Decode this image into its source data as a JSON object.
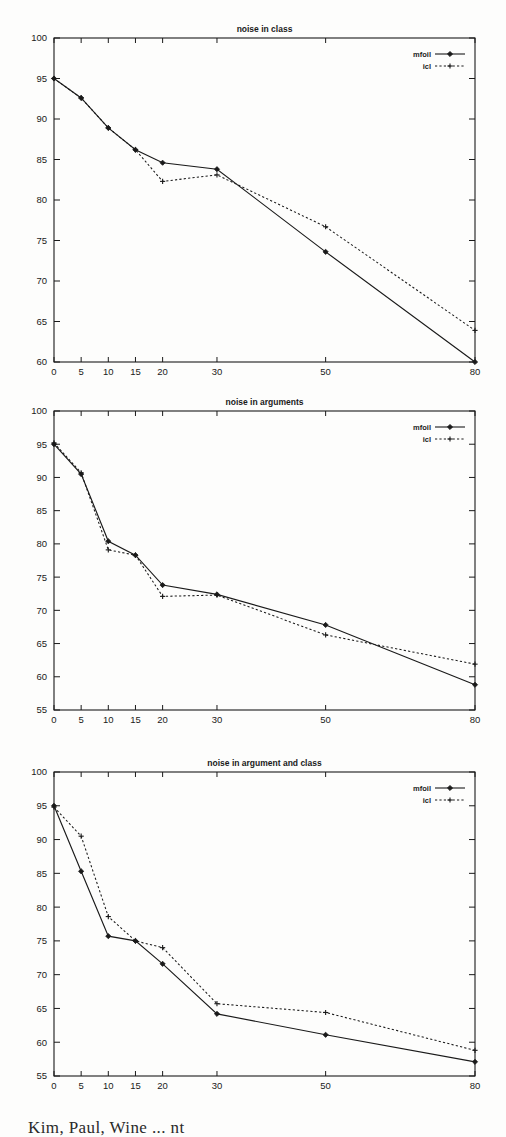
{
  "page": {
    "background_color": "#fdfdfc",
    "ink_color": "#1a1a1a",
    "bottom_caption": "Kim, Paul, Wine ... nt"
  },
  "legend_common": {
    "series_1_label": "mfoil",
    "series_2_label": "icl",
    "position": "top-right"
  },
  "chart_data": [
    {
      "id": "noise-in-class",
      "type": "line",
      "title": "noise in class",
      "xlabel": "",
      "ylabel": "",
      "x": [
        0,
        5,
        10,
        15,
        20,
        30,
        50,
        80
      ],
      "xtick_labels": [
        "0",
        "5",
        "10",
        "15",
        "20",
        "30",
        "50",
        "80"
      ],
      "ytick_labels": [
        "60",
        "65",
        "70",
        "75",
        "80",
        "85",
        "90",
        "95",
        "100"
      ],
      "ylim": [
        60,
        100
      ],
      "grid": false,
      "legend_position": "top-right",
      "series": [
        {
          "name": "mfoil",
          "style": "solid",
          "marker": "filled-diamond",
          "values": [
            95.0,
            92.6,
            88.9,
            86.2,
            84.6,
            83.8,
            73.6,
            60.0
          ]
        },
        {
          "name": "icl",
          "style": "dotted",
          "marker": "plus",
          "values": [
            95.0,
            92.6,
            88.9,
            86.2,
            82.3,
            83.1,
            76.7,
            63.9
          ]
        }
      ]
    },
    {
      "id": "noise-in-arguments",
      "type": "line",
      "title": "noise in arguments",
      "xlabel": "",
      "ylabel": "",
      "x": [
        0,
        5,
        10,
        15,
        20,
        30,
        50,
        80
      ],
      "xtick_labels": [
        "0",
        "5",
        "10",
        "15",
        "20",
        "30",
        "50",
        "80"
      ],
      "ytick_labels": [
        "55",
        "60",
        "65",
        "70",
        "75",
        "80",
        "85",
        "90",
        "95",
        "100"
      ],
      "ylim": [
        55,
        100
      ],
      "grid": false,
      "legend_position": "top-right",
      "series": [
        {
          "name": "mfoil",
          "style": "solid",
          "marker": "filled-diamond",
          "values": [
            95.0,
            90.5,
            80.4,
            78.3,
            73.8,
            72.4,
            67.8,
            58.8
          ]
        },
        {
          "name": "icl",
          "style": "dotted",
          "marker": "plus",
          "values": [
            95.2,
            90.7,
            79.1,
            78.3,
            72.1,
            72.3,
            66.3,
            61.9
          ]
        }
      ]
    },
    {
      "id": "noise-in-argument-and-class",
      "type": "line",
      "title": "noise in argument and class",
      "xlabel": "",
      "ylabel": "",
      "x": [
        0,
        5,
        10,
        15,
        20,
        30,
        50,
        80
      ],
      "xtick_labels": [
        "0",
        "5",
        "10",
        "15",
        "20",
        "30",
        "50",
        "80"
      ],
      "ytick_labels": [
        "55",
        "60",
        "65",
        "70",
        "75",
        "80",
        "85",
        "90",
        "95",
        "100"
      ],
      "ylim": [
        55,
        100
      ],
      "grid": false,
      "legend_position": "top-right",
      "series": [
        {
          "name": "mfoil",
          "style": "solid",
          "marker": "filled-diamond",
          "values": [
            95.0,
            85.3,
            75.7,
            75.0,
            71.6,
            64.2,
            61.1,
            57.1
          ]
        },
        {
          "name": "icl",
          "style": "dotted",
          "marker": "plus",
          "values": [
            94.8,
            90.5,
            78.6,
            75.0,
            74.0,
            65.7,
            64.4,
            58.8
          ]
        }
      ]
    }
  ]
}
